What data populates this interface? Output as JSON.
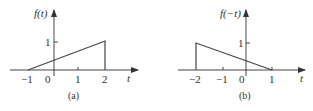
{
  "panels": [
    {
      "id": "a",
      "ylabel": "f(t)",
      "xlabel": "t",
      "caption": "(a)",
      "x_ticks": [
        "-1",
        "0",
        "1",
        "2"
      ],
      "y_tick": "1"
    },
    {
      "id": "b",
      "ylabel": "f(-t)",
      "xlabel": "t",
      "caption": "(b)",
      "x_ticks": [
        "-2",
        "-1",
        "0",
        "1"
      ],
      "y_tick": "1"
    }
  ],
  "labels": {
    "a_ylabel": "f(t)",
    "a_xlabel": "t",
    "a_caption": "(a)",
    "a_tick_m1": "−1",
    "a_tick_0": "0",
    "a_tick_1": "1",
    "a_tick_2": "2",
    "a_ytick_1": "1",
    "b_ylabel": "f(−t)",
    "b_xlabel": "t",
    "b_caption": "(b)",
    "b_tick_m2": "−2",
    "b_tick_m1": "−1",
    "b_tick_0": "0",
    "b_tick_1": "1",
    "b_ytick_1": "1"
  },
  "colors": {
    "line": "#444444",
    "text": "#333333"
  }
}
